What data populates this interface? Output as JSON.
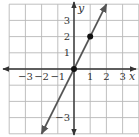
{
  "chart_data": {
    "type": "line",
    "title": "",
    "xlabel": "x",
    "ylabel": "y",
    "xlim": [
      -4,
      4
    ],
    "ylim": [
      -4,
      4
    ],
    "grid": true,
    "x_tick_labels": [
      "−3",
      "−2",
      "−1",
      "1",
      "2",
      "3"
    ],
    "x_ticks": [
      -3,
      -2,
      -1,
      1,
      2,
      3
    ],
    "y_tick_labels": [
      "3",
      "2",
      "1",
      "−3"
    ],
    "y_ticks": [
      3,
      2,
      1,
      -3
    ],
    "series": [
      {
        "name": "y = 2x",
        "equation": "y = 2x",
        "line_start": [
          -2,
          -4
        ],
        "line_end": [
          2,
          4
        ],
        "arrows_both_ends": true,
        "points": [
          [
            0,
            0
          ],
          [
            1,
            2
          ]
        ]
      }
    ]
  },
  "labels": {
    "x_axis": "x",
    "y_axis": "y"
  },
  "colors": {
    "grid": "#b8b8b8",
    "axis": "#333333",
    "line": "#555555",
    "point": "#111111"
  }
}
